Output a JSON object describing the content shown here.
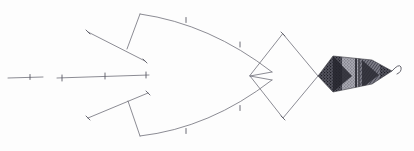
{
  "figure": {
    "background_color": "#fdfdfd",
    "line_color": "#6e6e78",
    "texture_dark_color": "#3a3a42",
    "texture_mid_color": "#7a7a84",
    "width": 414,
    "height": 151
  },
  "guide_lines": [
    {
      "name": "short-guide-line",
      "x1": 8,
      "y1": 78,
      "x2": 43,
      "y2": 77,
      "ticks": [
        {
          "x": 30,
          "y": 77
        }
      ]
    },
    {
      "name": "long-guide-line",
      "x1": 57,
      "y1": 78,
      "x2": 149,
      "y2": 75,
      "ticks": [
        {
          "x": 62,
          "y": 78
        },
        {
          "x": 105,
          "y": 76
        },
        {
          "x": 146,
          "y": 75
        }
      ]
    }
  ],
  "upper_strut": {
    "name": "upper-strut",
    "diagonal": {
      "x1": 88,
      "y1": 32,
      "x2": 145,
      "y2": 61
    },
    "vertical": {
      "x1": 127,
      "y1": 49,
      "x2": 140,
      "y2": 14
    }
  },
  "lower_strut": {
    "name": "lower-strut",
    "diagonal": {
      "x1": 88,
      "y1": 118,
      "x2": 148,
      "y2": 93
    },
    "vertical": {
      "x1": 128,
      "y1": 101,
      "x2": 140,
      "y2": 136
    }
  },
  "upper_arc": {
    "name": "upper-wing-arc",
    "path": "M140,14 Q210,24 272,72",
    "ticks": [
      {
        "x": 186,
        "y": 20
      },
      {
        "x": 240,
        "y": 45
      }
    ]
  },
  "lower_arc": {
    "name": "lower-wing-arc",
    "path": "M140,136 Q210,128 272,80",
    "ticks": [
      {
        "x": 186,
        "y": 131
      },
      {
        "x": 240,
        "y": 108
      }
    ]
  },
  "diamond": {
    "name": "center-diamond",
    "points": "283,34 318,76 283,118 250,76",
    "vertices": [
      {
        "label": "top",
        "x": 283,
        "y": 34
      },
      {
        "label": "right",
        "x": 318,
        "y": 76
      },
      {
        "label": "bottom",
        "x": 283,
        "y": 118
      },
      {
        "label": "left",
        "x": 250,
        "y": 76
      }
    ]
  },
  "notch": {
    "name": "arc-notch",
    "upper": {
      "x1": 250,
      "y1": 76,
      "x2": 272,
      "y2": 72
    },
    "lower": {
      "x1": 250,
      "y1": 76,
      "x2": 272,
      "y2": 80
    }
  },
  "tail": {
    "name": "textured-tail",
    "outline": "M318,76 L333,56 L372,60 L392,71 L372,84 L333,92 Z",
    "segments": [
      {
        "name": "tail-segment-1",
        "x": 318,
        "width": 24,
        "shade": "#3f3f48"
      },
      {
        "name": "tail-segment-2",
        "x": 342,
        "width": 18,
        "shade": "#8a8a94"
      },
      {
        "name": "tail-segment-3",
        "x": 360,
        "width": 20,
        "shade": "#4a4a54"
      },
      {
        "name": "tail-segment-4",
        "x": 380,
        "width": 14,
        "shade": "#6e6e78"
      }
    ],
    "hook": {
      "path": "M392,71 Q399,63 401,67 Q402,72 397,74"
    }
  }
}
